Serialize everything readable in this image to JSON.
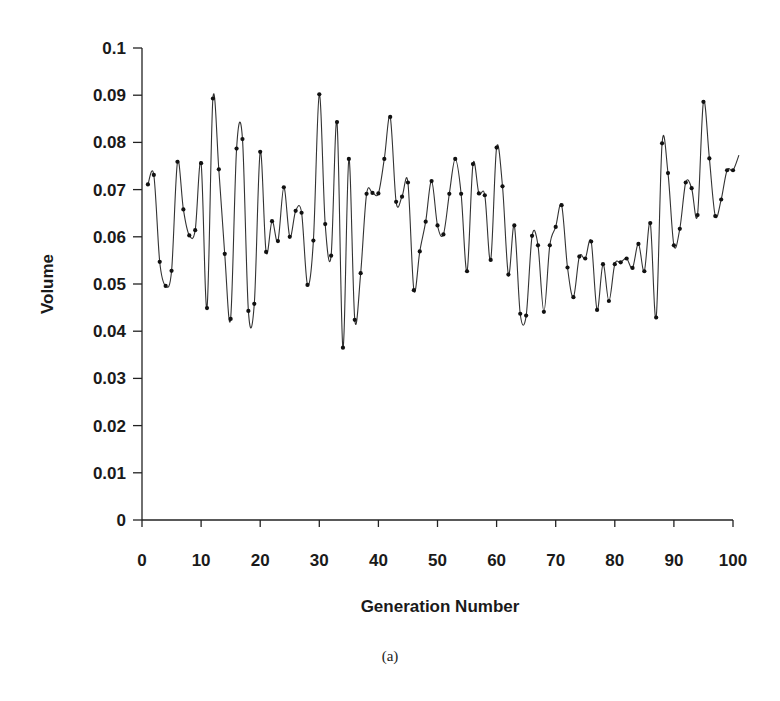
{
  "chart_data": {
    "type": "line",
    "title": "",
    "caption": "(a)",
    "xlabel": "Generation Number",
    "ylabel": "Volume",
    "xlim": [
      0,
      100
    ],
    "ylim": [
      0,
      0.1
    ],
    "x_ticks": [
      0,
      10,
      20,
      30,
      40,
      50,
      60,
      70,
      80,
      90,
      100
    ],
    "x_tick_labels": [
      "0",
      "10",
      "20",
      "30",
      "40",
      "50",
      "60",
      "70",
      "80",
      "90",
      "100"
    ],
    "y_ticks": [
      0,
      0.01,
      0.02,
      0.03,
      0.04,
      0.05,
      0.06,
      0.07,
      0.08,
      0.09,
      0.1
    ],
    "y_tick_labels": [
      "0",
      "0.01",
      "0.02",
      "0.03",
      "0.04",
      "0.05",
      "0.06",
      "0.07",
      "0.08",
      "0.09",
      "0.1"
    ],
    "grid": false,
    "legend": null,
    "line_color": "#333333",
    "marker": "dot",
    "series": [
      {
        "name": "Volume",
        "x": [
          1,
          2,
          3,
          4,
          5,
          6,
          7,
          8,
          9,
          10,
          11,
          12,
          13,
          14,
          15,
          16,
          17,
          18,
          19,
          20,
          21,
          22,
          23,
          24,
          25,
          26,
          27,
          28,
          29,
          30,
          31,
          32,
          33,
          34,
          35,
          36,
          37,
          38,
          39,
          40,
          41,
          42,
          43,
          44,
          45,
          46,
          47,
          48,
          49,
          50,
          51,
          52,
          53,
          54,
          55,
          56,
          57,
          58,
          59,
          60,
          61,
          62,
          63,
          64,
          65,
          66,
          67,
          68,
          69,
          70,
          71,
          72,
          73,
          74,
          75,
          76,
          77,
          78,
          79,
          80,
          81,
          82,
          83,
          84,
          85,
          86,
          87,
          88,
          89,
          90,
          91,
          92,
          93,
          94,
          95,
          96,
          97,
          98,
          99,
          100
        ],
        "values": [
          0.0711,
          0.0731,
          0.0547,
          0.0496,
          0.0528,
          0.0759,
          0.0658,
          0.0603,
          0.0614,
          0.0756,
          0.0449,
          0.0893,
          0.0743,
          0.0564,
          0.0426,
          0.0787,
          0.0807,
          0.0443,
          0.0458,
          0.078,
          0.0568,
          0.0633,
          0.0591,
          0.0705,
          0.06,
          0.0655,
          0.0651,
          0.0498,
          0.0592,
          0.0902,
          0.0627,
          0.056,
          0.0843,
          0.0365,
          0.0765,
          0.0424,
          0.0523,
          0.0691,
          0.0693,
          0.0692,
          0.0765,
          0.0854,
          0.0674,
          0.0685,
          0.0715,
          0.0487,
          0.0569,
          0.0632,
          0.0718,
          0.0624,
          0.0605,
          0.0691,
          0.0765,
          0.0691,
          0.0527,
          0.0754,
          0.0692,
          0.0688,
          0.0551,
          0.0789,
          0.0707,
          0.052,
          0.0624,
          0.0437,
          0.0433,
          0.0602,
          0.0582,
          0.0441,
          0.0582,
          0.0621,
          0.0667,
          0.0535,
          0.0472,
          0.0558,
          0.0554,
          0.059,
          0.0445,
          0.0542,
          0.0464,
          0.0542,
          0.0546,
          0.0554,
          0.0534,
          0.0585,
          0.0527,
          0.0629,
          0.0429,
          0.0798,
          0.0735,
          0.0582,
          0.0617,
          0.0715,
          0.0703,
          0.0646,
          0.0886,
          0.0766,
          0.0644,
          0.0679,
          0.0741,
          0.0741
        ]
      }
    ],
    "line_end": {
      "x": 101,
      "y": 0.0773
    }
  }
}
